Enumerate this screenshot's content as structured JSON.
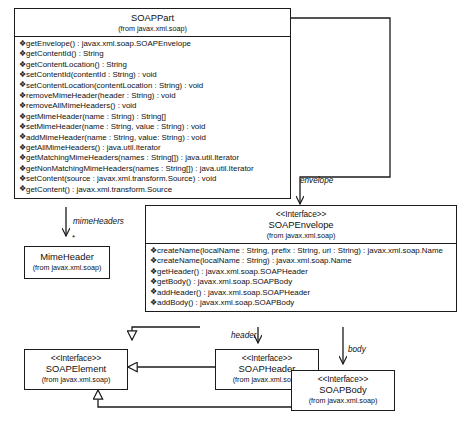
{
  "diagram": {
    "classes": {
      "soappart": {
        "name": "SOAPPart",
        "package": "(from javax.xml.soap)",
        "stereotype": "",
        "visibility_glyph": "❖",
        "methods": [
          "getEnvelope() : javax.xml.soap.SOAPEnvelope",
          "getContentId() : String",
          "getContentLocation() : String",
          "setContentId(contentId : String) : void",
          "setContentLocation(contentLocation : String) : void",
          "removeMimeHeader(header : String) : void",
          "removeAllMimeHeaders() : void",
          "getMimeHeader(name : String) : String[]",
          "setMimeHeader(name : String, value : String) : void",
          "addMimeHeader(name : String, value: String) : void",
          "getAllMimeHeaders() : java.util.Iterator",
          "getMatchingMimeHeaders(names : String[]) : java.util.Iterator",
          "getNonMatchingMimeHeaders(names : String[]) : java.util.Iterator",
          "setContent(source : javax.xml.transform.Source) : void",
          "getContent() : javax.xml.transform.Source"
        ]
      },
      "soapenvelope": {
        "name": "SOAPEnvelope",
        "package": "(from javax.xml.soap)",
        "stereotype": "<<Interface>>",
        "visibility_glyph": "❖",
        "methods": [
          "createName(localName : String, prefix : String, uri : String) : javax.xml.soap.Name",
          "createName(localName : String) : javax.xml.soap.Name",
          "getHeader() : javax.xml.soap.SOAPHeader",
          "getBody() : javax.xml.soap.SOAPBody",
          "addHeader() : javax.xml.soap.SOAPHeader",
          "addBody() : javax.xml.soap.SOAPBody"
        ]
      },
      "mimeheader": {
        "name": "MimeHeader",
        "package": "(from javax.xml.soap)",
        "stereotype": "",
        "methods": []
      },
      "soapelement": {
        "name": "SOAPElement",
        "package": "(from javax.xml.soap)",
        "stereotype": "<<Interface>>",
        "methods": []
      },
      "soapheader": {
        "name": "SOAPHeader",
        "package": "(from javax.xml.soap)",
        "stereotype": "<<Interface>>",
        "methods": []
      },
      "soapbody": {
        "name": "SOAPBody",
        "package": "(from javax.xml.soap)",
        "stereotype": "<<Interface>>",
        "methods": []
      }
    },
    "edge_labels": {
      "mime_headers": "mimeHeaders",
      "mime_multiplicity": "*",
      "envelope": "envelope",
      "header": "header",
      "body": "body"
    },
    "colors": {
      "line": "#1b1b1b",
      "text": "#111111",
      "background": "#ffffff"
    }
  }
}
